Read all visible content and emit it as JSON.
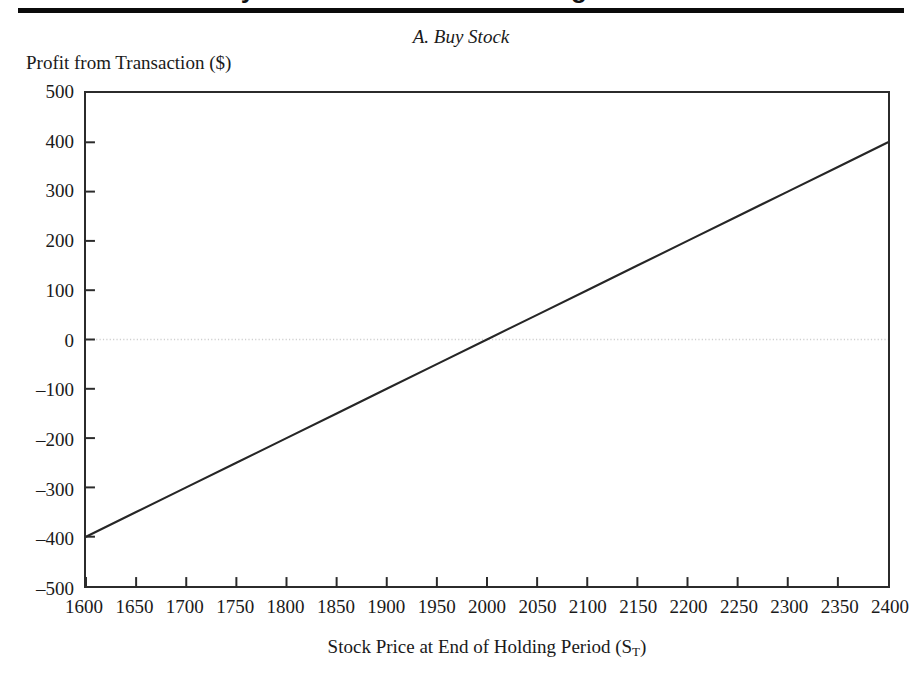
{
  "page": {
    "clipped_heading": "Payoffs and Profits from Long Positions",
    "panel_title": "A. Buy Stock",
    "y_axis_caption": "Profit from Transaction ($)",
    "x_axis_caption_main": "Stock Price at End of Holding Period (S",
    "x_axis_caption_sub": "T",
    "x_axis_caption_close": ")"
  },
  "colors": {
    "rule": "#0b0b0b",
    "axis": "#2b2b2b",
    "data_line": "#262626",
    "zero_line": "#cfcfcf",
    "text": "#1a1a1a",
    "background": "#ffffff"
  },
  "chart_data": {
    "type": "line",
    "title": "A. Buy Stock",
    "xlabel": "Stock Price at End of Holding Period (S_T)",
    "ylabel": "Profit from Transaction ($)",
    "xlim": [
      1600,
      2400
    ],
    "ylim": [
      -500,
      500
    ],
    "grid": false,
    "legend": "none",
    "zero_reference_line": 0,
    "x_ticks": [
      1600,
      1650,
      1700,
      1750,
      1800,
      1850,
      1900,
      1950,
      2000,
      2050,
      2100,
      2150,
      2200,
      2250,
      2300,
      2350,
      2400
    ],
    "y_ticks": [
      500,
      400,
      300,
      200,
      100,
      0,
      -100,
      -200,
      -300,
      -400,
      -500
    ],
    "x_tick_labels": [
      "1600",
      "1650",
      "1700",
      "1750",
      "1800",
      "1850",
      "1900",
      "1950",
      "2000",
      "2050",
      "2100",
      "2150",
      "2200",
      "2250",
      "2300",
      "2350",
      "2400"
    ],
    "y_tick_labels": [
      "500",
      "400",
      "300",
      "200",
      "100",
      "0",
      "–100",
      "–200",
      "–300",
      "–400",
      "–500"
    ],
    "series": [
      {
        "name": "Buy Stock profit",
        "x": [
          1600,
          1650,
          1700,
          1750,
          1800,
          1850,
          1900,
          1950,
          2000,
          2050,
          2100,
          2150,
          2200,
          2250,
          2300,
          2350,
          2400
        ],
        "values": [
          -400,
          -350,
          -300,
          -250,
          -200,
          -150,
          -100,
          -50,
          0,
          50,
          100,
          150,
          200,
          250,
          300,
          350,
          400
        ],
        "breakeven_x": 2000,
        "slope": 1,
        "intercept": -2000
      }
    ]
  }
}
